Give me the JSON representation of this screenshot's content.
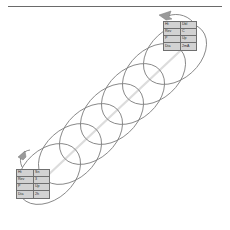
{
  "figure": {
    "kind": "helix-coil-diagram",
    "background": "#ffffff",
    "stroke_color": "#7d7d7d",
    "axis_color": "#d8d8d8",
    "rule_color": "#6a6a6a",
    "callout_fill": "#d2d2d2",
    "callout_border": "#6f6f6f",
    "turns": 7
  },
  "rule": {
    "name": "top-divider"
  },
  "callouts": {
    "top": {
      "rows": [
        {
          "label": "Ht",
          "value": "Dbl"
        },
        {
          "label": "Rev",
          "value": "C"
        },
        {
          "label": "P",
          "value": "Up"
        },
        {
          "label": "Dia",
          "value": "2mA"
        }
      ]
    },
    "bottom": {
      "rows": [
        {
          "label": "Ht",
          "value": "Sn"
        },
        {
          "label": "Rev",
          "value": "3"
        },
        {
          "label": "P",
          "value": "Up"
        },
        {
          "label": "Dia",
          "value": "2h"
        }
      ]
    }
  },
  "leaders": {
    "top_arrow": "arrow-head-left",
    "bottom_arrow": "arrow-head-up-left"
  }
}
